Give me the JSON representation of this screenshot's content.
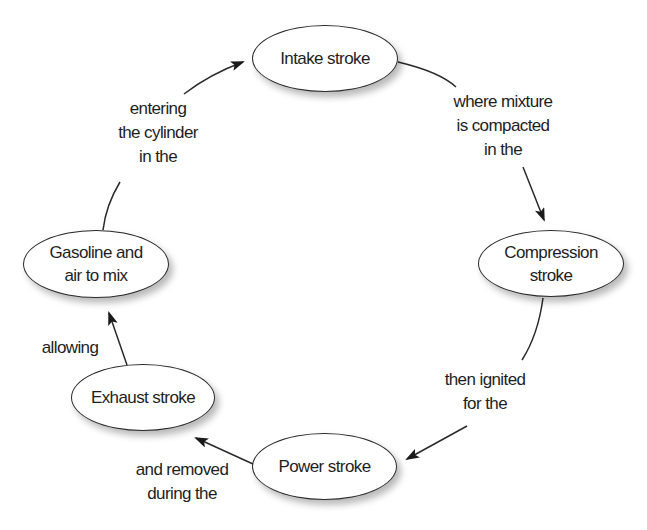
{
  "diagram": {
    "nodes": [
      {
        "id": "intake",
        "label": "Intake stroke"
      },
      {
        "id": "compression",
        "label": "Compression\nstroke"
      },
      {
        "id": "power",
        "label": "Power stroke"
      },
      {
        "id": "exhaust",
        "label": "Exhaust stroke"
      },
      {
        "id": "gasoline",
        "label": "Gasoline and\nair to mix"
      }
    ],
    "edges": [
      {
        "from": "intake",
        "to": "compression",
        "label": "where mixture\nis compacted\nin the"
      },
      {
        "from": "compression",
        "to": "power",
        "label": "then ignited\nfor the"
      },
      {
        "from": "power",
        "to": "exhaust",
        "label": "and removed\nduring the"
      },
      {
        "from": "exhaust",
        "to": "gasoline",
        "label": "allowing"
      },
      {
        "from": "gasoline",
        "to": "intake",
        "label": "entering\nthe cylinder\nin the"
      }
    ],
    "colors": {
      "stroke": "#2a2a2a",
      "node_fill": "#ffffff",
      "text": "#1e1e1e",
      "background": "#ffffff"
    }
  }
}
